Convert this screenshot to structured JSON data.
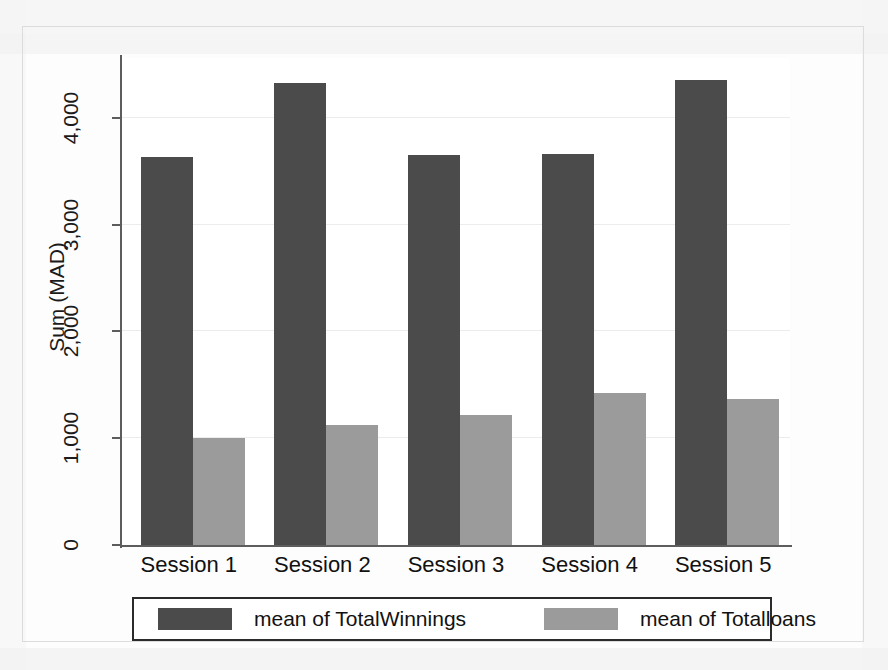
{
  "chart_data": {
    "type": "bar",
    "title": "",
    "subtitle": "",
    "xlabel": "",
    "ylabel": "Sum (MAD)",
    "categories": [
      "Session 1",
      "Session 2",
      "Session 3",
      "Session 4",
      "Session 5"
    ],
    "series": [
      {
        "name": "mean of TotalWinnings",
        "color": "#4b4b4b",
        "values": [
          3635,
          4330,
          3655,
          3660,
          4350
        ]
      },
      {
        "name": "mean of Totalloans",
        "color": "#9b9b9b",
        "values": [
          998,
          1126,
          1217,
          1419,
          1364
        ]
      }
    ],
    "ylim": [
      0,
      4560
    ],
    "yticks": [
      0,
      1000,
      2000,
      3000,
      4000
    ],
    "ytick_labels": [
      "0",
      "1,000",
      "2,000",
      "3,000",
      "4,000"
    ],
    "grid": true,
    "grid_axis": "y",
    "legend_position": "bottom",
    "legend_entries": [
      {
        "label": "mean of TotalWinnings",
        "color": "#4b4b4b"
      },
      {
        "label": "mean of Totalloans",
        "color": "#9b9b9b"
      }
    ]
  },
  "axes": {
    "y_title": "Sum (MAD)",
    "tick_labels": [
      "0",
      "1,000",
      "2,000",
      "3,000",
      "4,000"
    ]
  },
  "legend": {
    "entries": [
      {
        "label": "mean of TotalWinnings"
      },
      {
        "label": "mean of Totalloans"
      }
    ]
  },
  "colors": {
    "dark_bar": "#4b4b4b",
    "light_bar": "#9b9b9b",
    "axis": "#5d5d5d",
    "gridline": "#ececec",
    "background": "#ffffff"
  }
}
